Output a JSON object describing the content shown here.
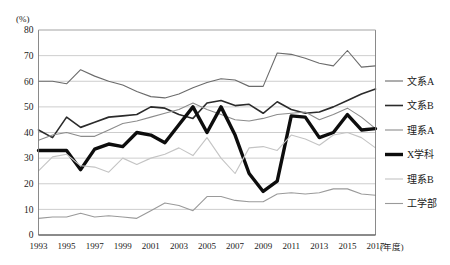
{
  "chart_data": {
    "type": "line",
    "title": "",
    "xlabel": "(年度)",
    "ylabel": "(%)",
    "ylim": [
      0,
      80
    ],
    "ytick_step": 10,
    "yticks": [
      "0",
      "10",
      "20",
      "30",
      "40",
      "50",
      "60",
      "70",
      "80"
    ],
    "xlim": [
      1993,
      2017
    ],
    "xticks": [
      "1993",
      "1995",
      "1997",
      "1999",
      "2001",
      "2003",
      "2005",
      "2007",
      "2009",
      "2011",
      "2013",
      "2015",
      "2017"
    ],
    "x": [
      1993,
      1994,
      1995,
      1996,
      1997,
      1998,
      1999,
      2000,
      2001,
      2002,
      2003,
      2004,
      2005,
      2006,
      2007,
      2008,
      2009,
      2010,
      2011,
      2012,
      2013,
      2014,
      2015,
      2016,
      2017
    ],
    "grid": true,
    "legend_position": "right",
    "series": [
      {
        "name": "文系A",
        "color": "#6b6b6b",
        "width": 1.1,
        "values": [
          60,
          60,
          59,
          64.5,
          62,
          60,
          58.5,
          56,
          54,
          53.5,
          55,
          57.5,
          59.5,
          61,
          60.5,
          58,
          58,
          71,
          70.5,
          69,
          67,
          66,
          72,
          65.5,
          66
        ]
      },
      {
        "name": "文系B",
        "color": "#2b2b2b",
        "width": 1.6,
        "values": [
          41,
          38,
          46,
          42,
          44,
          46,
          46.5,
          47,
          50,
          49.5,
          47,
          45.5,
          51.5,
          52.5,
          50.5,
          51,
          47.5,
          52,
          49,
          47.5,
          48,
          50,
          52.5,
          55,
          57
        ]
      },
      {
        "name": "理系A",
        "color": "#8c8c8c",
        "width": 1.1,
        "values": [
          37,
          39,
          40,
          38.5,
          38.5,
          41,
          43.5,
          44.5,
          46,
          47.5,
          49,
          51.5,
          49,
          47,
          45,
          44.5,
          45.5,
          47,
          47.5,
          48,
          45,
          47,
          49.5,
          46,
          41.5
        ]
      },
      {
        "name": "X学科",
        "color": "#0d0d0d",
        "width": 3.4,
        "values": [
          33,
          33,
          33,
          25.5,
          33.5,
          35.5,
          34.5,
          40,
          39,
          36,
          43,
          50,
          40,
          50,
          39,
          24,
          17,
          21,
          46.5,
          46,
          38,
          40,
          47,
          41,
          41.5
        ]
      },
      {
        "name": "理系B",
        "color": "#c4c4c4",
        "width": 1.1,
        "values": [
          25,
          30.5,
          31.5,
          27,
          26.5,
          24.5,
          30,
          27.5,
          30,
          31.5,
          34,
          31,
          38,
          30,
          24,
          34,
          34.5,
          33,
          39,
          37.5,
          35,
          39,
          40,
          38,
          34
        ]
      },
      {
        "name": "工学部",
        "color": "#9a9a9a",
        "width": 1.1,
        "values": [
          6.5,
          7,
          7,
          8.5,
          7,
          7.5,
          7,
          6.5,
          9.5,
          12.5,
          11.5,
          9.5,
          15,
          15,
          13.5,
          13,
          13,
          16,
          16.5,
          16,
          16.5,
          18,
          18,
          16,
          15.5
        ]
      }
    ]
  },
  "legend": {
    "items": [
      {
        "label": "文系A"
      },
      {
        "label": "文系B"
      },
      {
        "label": "理系A"
      },
      {
        "label": "X学科"
      },
      {
        "label": "理系B"
      },
      {
        "label": "工学部"
      }
    ]
  }
}
